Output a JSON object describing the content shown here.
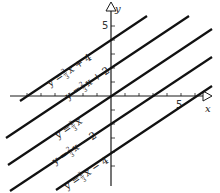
{
  "diagram": {
    "type": "coordinate-plane-parallel-lines",
    "axes": {
      "x_label": "x",
      "y_label": "y",
      "x_tick_label": "5",
      "y_tick_label": "5"
    },
    "lines": [
      {
        "id": "b4",
        "slope_num": "2",
        "slope_den": "3",
        "prefix": "y = ",
        "suffix": "x + 4"
      },
      {
        "id": "b2",
        "slope_num": "2",
        "slope_den": "3",
        "prefix": "y = ",
        "suffix": "x + 2"
      },
      {
        "id": "b0",
        "slope_num": "2",
        "slope_den": "3",
        "prefix": "y = ",
        "suffix": "x"
      },
      {
        "id": "bm2",
        "slope_num": "2",
        "slope_den": "3",
        "prefix": "y = ",
        "suffix": "x − 2"
      },
      {
        "id": "bm4",
        "slope_num": "2",
        "slope_den": "3",
        "prefix": "y = ",
        "suffix": "x − 4"
      }
    ],
    "colors": {
      "line": "#111111",
      "axis": "#1a1a1a",
      "background": "#ffffff"
    }
  }
}
